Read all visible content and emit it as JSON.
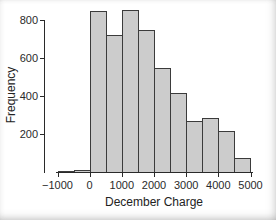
{
  "chart_data": {
    "type": "bar",
    "subtype": "histogram",
    "title": "",
    "xlabel": "December Charge",
    "ylabel": "Frequency",
    "bin_edges": [
      -1000,
      -500,
      0,
      500,
      1000,
      1500,
      2000,
      2500,
      3000,
      3500,
      4000,
      4500,
      5000
    ],
    "values": [
      5,
      10,
      845,
      720,
      855,
      750,
      545,
      415,
      270,
      285,
      215,
      75
    ],
    "xticks": [
      -1000,
      0,
      1000,
      2000,
      3000,
      4000,
      5000
    ],
    "xtick_labels": [
      "−1000",
      "0",
      "1000",
      "2000",
      "3000",
      "4000",
      "5000"
    ],
    "yticks": [
      200,
      400,
      600,
      800
    ],
    "ytick_labels": [
      "200",
      "400",
      "600",
      "800"
    ],
    "xlim": [
      -1000,
      5000
    ],
    "ylim": [
      0,
      870
    ],
    "grid": false,
    "legend": null,
    "bar_fill": "#cccccc",
    "bar_stroke": "#3b3b3b",
    "axis_color": "#2a2a2a",
    "text_color": "#222222",
    "background": "#ffffff"
  }
}
